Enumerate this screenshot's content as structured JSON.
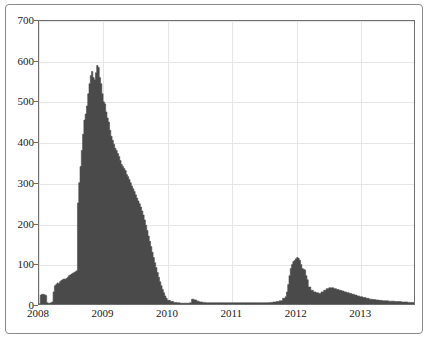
{
  "chart_data": {
    "type": "area",
    "title": "",
    "subtitle": "",
    "xlabel": "",
    "ylabel": "",
    "xlim": [
      2008.0,
      2013.85
    ],
    "ylim": [
      0,
      700
    ],
    "grid": true,
    "legend": null,
    "series_color": "#4a4a4a",
    "x_tick_labels": [
      "2008",
      "2009",
      "2010",
      "2011",
      "2012",
      "2013"
    ],
    "x_tick_values": [
      2008,
      2009,
      2010,
      2011,
      2012,
      2013
    ],
    "y_tick_labels": [
      "0",
      "100",
      "200",
      "300",
      "400",
      "500",
      "600",
      "700"
    ],
    "y_tick_values": [
      0,
      100,
      200,
      300,
      400,
      500,
      600,
      700
    ],
    "series": [
      {
        "name": "count",
        "x": [
          2008.0,
          2008.02,
          2008.04,
          2008.06,
          2008.08,
          2008.1,
          2008.12,
          2008.14,
          2008.16,
          2008.18,
          2008.2,
          2008.22,
          2008.24,
          2008.26,
          2008.28,
          2008.3,
          2008.32,
          2008.34,
          2008.36,
          2008.38,
          2008.4,
          2008.42,
          2008.44,
          2008.46,
          2008.48,
          2008.5,
          2008.52,
          2008.54,
          2008.56,
          2008.58,
          2008.6,
          2008.62,
          2008.64,
          2008.66,
          2008.68,
          2008.7,
          2008.72,
          2008.74,
          2008.76,
          2008.78,
          2008.8,
          2008.82,
          2008.84,
          2008.86,
          2008.88,
          2008.9,
          2008.92,
          2008.94,
          2008.96,
          2008.98,
          2009.0,
          2009.02,
          2009.04,
          2009.06,
          2009.08,
          2009.1,
          2009.12,
          2009.14,
          2009.16,
          2009.18,
          2009.2,
          2009.22,
          2009.24,
          2009.26,
          2009.28,
          2009.3,
          2009.32,
          2009.34,
          2009.36,
          2009.38,
          2009.4,
          2009.42,
          2009.44,
          2009.46,
          2009.48,
          2009.5,
          2009.52,
          2009.54,
          2009.56,
          2009.58,
          2009.6,
          2009.62,
          2009.64,
          2009.66,
          2009.68,
          2009.7,
          2009.72,
          2009.74,
          2009.76,
          2009.78,
          2009.8,
          2009.82,
          2009.84,
          2009.86,
          2009.88,
          2009.9,
          2009.92,
          2009.94,
          2009.96,
          2009.98,
          2010.0,
          2010.05,
          2010.1,
          2010.15,
          2010.2,
          2010.25,
          2010.3,
          2010.35,
          2010.38,
          2010.42,
          2010.46,
          2010.5,
          2010.55,
          2010.6,
          2010.7,
          2010.8,
          2010.9,
          2011.0,
          2011.1,
          2011.2,
          2011.3,
          2011.4,
          2011.5,
          2011.6,
          2011.65,
          2011.7,
          2011.75,
          2011.8,
          2011.84,
          2011.86,
          2011.88,
          2011.9,
          2011.92,
          2011.94,
          2011.96,
          2011.98,
          2012.0,
          2012.02,
          2012.04,
          2012.06,
          2012.08,
          2012.1,
          2012.12,
          2012.14,
          2012.16,
          2012.18,
          2012.2,
          2012.24,
          2012.28,
          2012.32,
          2012.36,
          2012.4,
          2012.44,
          2012.48,
          2012.52,
          2012.56,
          2012.6,
          2012.64,
          2012.68,
          2012.72,
          2012.76,
          2012.8,
          2012.84,
          2012.88,
          2012.92,
          2012.96,
          2013.0,
          2013.05,
          2013.1,
          2013.15,
          2013.2,
          2013.25,
          2013.3,
          2013.35,
          2013.4,
          2013.45,
          2013.5,
          2013.55,
          2013.6,
          2013.65,
          2013.7,
          2013.75,
          2013.8,
          2013.85
        ],
        "values": [
          0,
          22,
          24,
          24,
          23,
          21,
          3,
          2,
          2,
          3,
          5,
          30,
          45,
          48,
          52,
          50,
          55,
          58,
          60,
          62,
          61,
          63,
          66,
          70,
          72,
          74,
          76,
          78,
          80,
          82,
          250,
          300,
          340,
          380,
          420,
          455,
          470,
          490,
          520,
          545,
          565,
          575,
          560,
          555,
          572,
          590,
          585,
          560,
          545,
          520,
          500,
          495,
          475,
          460,
          450,
          430,
          415,
          405,
          395,
          385,
          380,
          372,
          365,
          355,
          345,
          340,
          335,
          330,
          320,
          315,
          308,
          300,
          292,
          285,
          278,
          270,
          262,
          255,
          248,
          240,
          230,
          220,
          208,
          195,
          182,
          168,
          155,
          142,
          128,
          115,
          102,
          90,
          78,
          66,
          55,
          45,
          36,
          28,
          20,
          14,
          9,
          6,
          4,
          3,
          2,
          2,
          2,
          3,
          12,
          10,
          7,
          5,
          4,
          3,
          3,
          3,
          3,
          3,
          3,
          3,
          3,
          3,
          3,
          4,
          5,
          6,
          8,
          14,
          18,
          30,
          48,
          70,
          88,
          98,
          105,
          108,
          112,
          115,
          113,
          108,
          98,
          88,
          86,
          84,
          70,
          60,
          42,
          34,
          30,
          28,
          26,
          30,
          34,
          38,
          40,
          40,
          38,
          36,
          34,
          32,
          30,
          28,
          26,
          24,
          22,
          20,
          18,
          16,
          14,
          12,
          11,
          10,
          9,
          8,
          8,
          7,
          7,
          6,
          6,
          5,
          5,
          4,
          4,
          3
        ]
      }
    ]
  }
}
